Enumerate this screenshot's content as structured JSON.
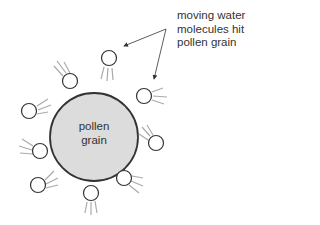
{
  "diagram": {
    "grain_label_line1": "pollen",
    "grain_label_line2": "grain",
    "annotation": [
      "moving water",
      "molecules hit",
      "pollen grain"
    ],
    "colors": {
      "grain_fill": "#dcdcdc",
      "outline": "#333333",
      "trail": "#aaaaaa",
      "background": "#ffffff"
    }
  }
}
